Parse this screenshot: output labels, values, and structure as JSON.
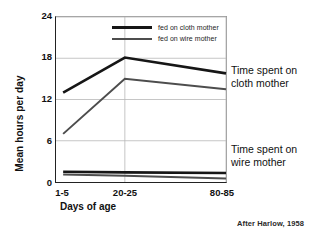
{
  "chart_data": {
    "type": "line",
    "title": "",
    "xlabel": "Days of age",
    "ylabel": "Mean hours per day",
    "categories": [
      "1-5",
      "20-25",
      "80-85"
    ],
    "x": [
      0,
      1,
      2
    ],
    "ylim": [
      0,
      24
    ],
    "yticks": [
      0,
      6,
      12,
      18,
      24
    ],
    "grid": true,
    "legend_position": "top-center",
    "series": [
      {
        "name": "Time spent on cloth mother",
        "legend": "fed on cloth mother",
        "group": "cloth-mother",
        "values": [
          13.0,
          18.1,
          15.8
        ],
        "color": "#161616",
        "width": 2.6
      },
      {
        "name": "Time spent on wire mother (fed on wire)",
        "legend": "fed on wire mother",
        "group": "cloth-mother",
        "values": [
          7.0,
          15.0,
          13.5
        ],
        "color": "#4d4d4d",
        "width": 2.0
      },
      {
        "name": "Time on wire mother - fed on cloth mother",
        "legend": "fed on cloth mother",
        "group": "wire-mother",
        "values": [
          1.5,
          1.4,
          1.3
        ],
        "color": "#161616",
        "width": 2.6
      },
      {
        "name": "Time on wire mother - fed on wire mother",
        "legend": "fed on wire mother",
        "group": "wire-mother",
        "values": [
          1.1,
          0.9,
          0.5
        ],
        "color": "#4d4d4d",
        "width": 2.0
      }
    ]
  },
  "axes": {
    "y_title": "Mean hours per day",
    "x_title": "Days of age",
    "y_tick_labels": [
      "24",
      "18",
      "12",
      "6",
      "0"
    ],
    "x_tick_labels": [
      "1-5",
      "20-25",
      "80-85"
    ]
  },
  "legend": {
    "items": [
      {
        "label": "fed on cloth mother",
        "style": "cloth"
      },
      {
        "label": "fed on wire mother",
        "style": "wire"
      }
    ]
  },
  "annotations": {
    "cloth": "Time spent on cloth mother",
    "wire": "Time spent on wire mother"
  },
  "attribution": "After Harlow, 1958",
  "colors": {
    "cloth_line": "#161616",
    "wire_line": "#4d4d4d",
    "grid": "#b8b8b8",
    "axis": "#222222"
  }
}
